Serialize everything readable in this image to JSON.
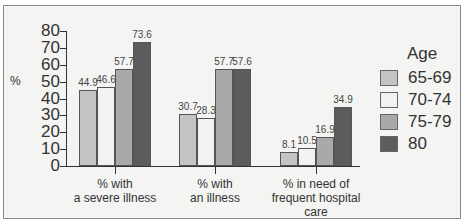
{
  "chart_data": {
    "type": "bar",
    "title": "",
    "xlabel": "",
    "ylabel": "%",
    "ylim": [
      0,
      80
    ],
    "yticks": [
      0,
      10,
      20,
      30,
      40,
      50,
      60,
      70,
      80
    ],
    "categories": [
      "% with a severe illness",
      "% with an illness",
      "% in need of frequent hospital care"
    ],
    "category_lines": [
      [
        "% with",
        "a severe illness"
      ],
      [
        "% with",
        "an illness"
      ],
      [
        "% in need of",
        "frequent hospital",
        "care"
      ]
    ],
    "legend_title": "Age",
    "legend_position": "right",
    "grid": false,
    "series": [
      {
        "name": "65-69",
        "color": "#c4c4c4",
        "values": [
          44.9,
          30.7,
          8.1
        ]
      },
      {
        "name": "70-74",
        "color": "#f2f2f0",
        "values": [
          46.6,
          28.3,
          10.5
        ]
      },
      {
        "name": "75-79",
        "color": "#a9a9a9",
        "values": [
          57.7,
          57.7,
          16.9
        ]
      },
      {
        "name": "80",
        "color": "#5c5c5e",
        "values": [
          73.6,
          57.6,
          34.9
        ]
      }
    ]
  }
}
